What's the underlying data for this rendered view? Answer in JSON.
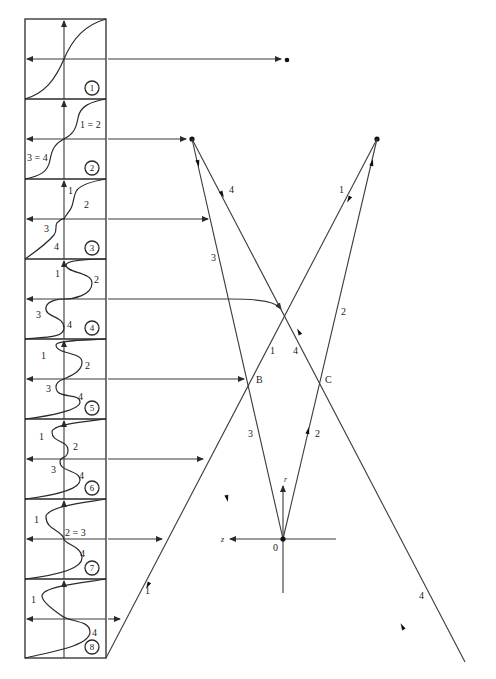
{
  "diagram": {
    "type": "ray-diagram-with-interference-panels",
    "panels": [
      {
        "index": "1",
        "labels": []
      },
      {
        "index": "2",
        "labels": [
          "1 = 2",
          "3 = 4"
        ]
      },
      {
        "index": "3",
        "labels": [
          "1",
          "2",
          "3",
          "4"
        ]
      },
      {
        "index": "4",
        "labels": [
          "1",
          "2",
          "3",
          "4"
        ]
      },
      {
        "index": "5",
        "labels": [
          "1",
          "2",
          "3",
          "4"
        ]
      },
      {
        "index": "6",
        "labels": [
          "1",
          "2",
          "3",
          "4"
        ]
      },
      {
        "index": "7",
        "labels": [
          "1",
          "2 = 3",
          "4"
        ]
      },
      {
        "index": "8",
        "labels": [
          "1",
          "4"
        ]
      }
    ],
    "points": {
      "B": "B",
      "C": "C",
      "origin": "0"
    },
    "axes": {
      "horizontal": "z",
      "vertical": "r"
    },
    "ray_labels": {
      "ray1_top": "1",
      "ray1_mid": "1",
      "ray1_bottom": "1",
      "ray2_top": "2",
      "ray2_bottom": "2",
      "ray3_top": "3",
      "ray3_bottom": "3",
      "ray4_top": "4",
      "ray4_mid": "4",
      "ray4_bottom": "4"
    },
    "colors": {
      "ink": "#2a2a2a",
      "background": "#ffffff"
    }
  }
}
